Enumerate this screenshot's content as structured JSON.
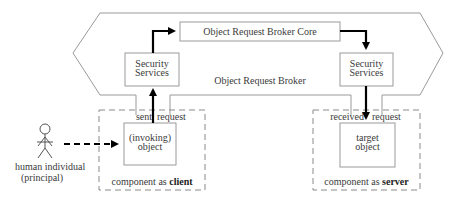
{
  "diagram": {
    "orb": {
      "label": "Object Request Broker",
      "core_label": "Object Request Broker Core"
    },
    "security_services_left": {
      "line1": "Security",
      "line2": "Services"
    },
    "security_services_right": {
      "line1": "Security",
      "line2": "Services"
    },
    "client_component": {
      "caption_prefix": "component as ",
      "caption_bold": "client",
      "object_line1": "(invoking)",
      "object_line2": "object",
      "label_sent": "sent",
      "label_request": "request"
    },
    "server_component": {
      "caption_prefix": "component as ",
      "caption_bold": "server",
      "object_line1": "target",
      "object_line2": "object",
      "label_received": "received",
      "label_request": "request"
    },
    "actor": {
      "line1": "human individual",
      "line2": "(principal)"
    },
    "colors": {
      "line": "#8a8a8a",
      "arrow": "#000000",
      "text": "#3a3a3a"
    }
  }
}
